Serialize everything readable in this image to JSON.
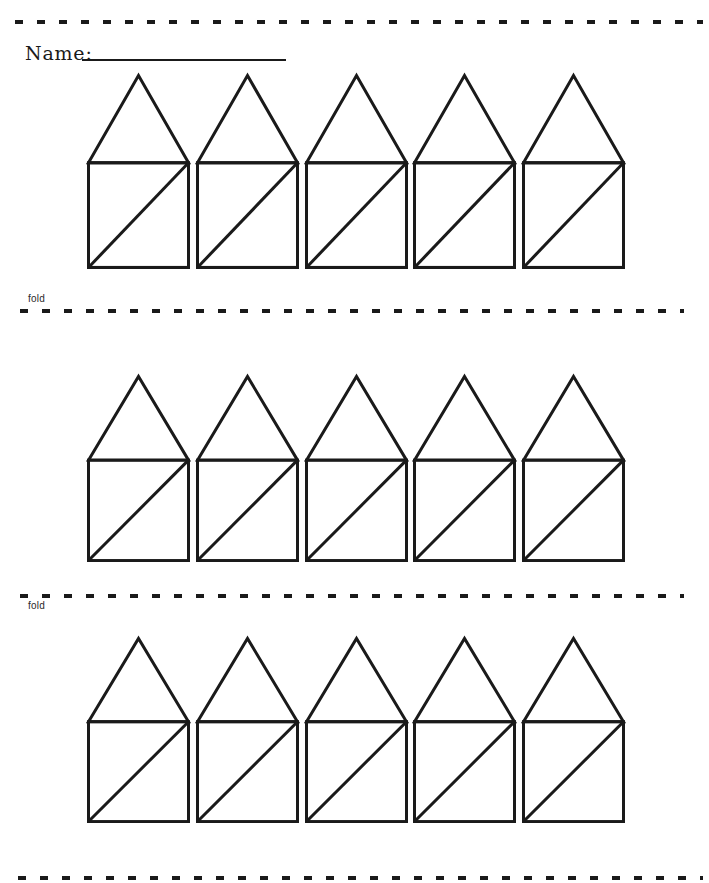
{
  "page": {
    "paper_color": "#ffffff",
    "ink_color": "#1a1a1a",
    "kind": "printable fold-and-cut worksheet"
  },
  "name_field": {
    "label": "Name:",
    "value": ""
  },
  "fold_markers": [
    {
      "label": "fold",
      "position": "above-line"
    },
    {
      "label": "fold",
      "position": "below-line"
    }
  ],
  "cut_lines": {
    "style": "dashed",
    "count": 4
  },
  "houses": {
    "rows": 3,
    "per_row": 5,
    "shape": "square-body-with-triangle-roof-and-bottomleft-to-topright-diagonal"
  }
}
